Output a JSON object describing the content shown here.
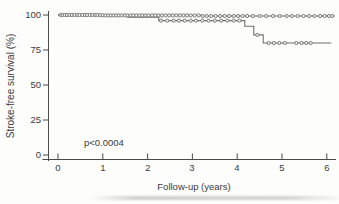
{
  "figure": {
    "background": "#fdfdfc"
  },
  "chart_data": {
    "type": "line",
    "subtype": "kaplan_meier_step_curves",
    "title": "",
    "xlabel": "Follow-up (years)",
    "ylabel": "Stroke-free survival (%)",
    "annotation": "p<0.0004",
    "xlim": [
      0,
      6.2
    ],
    "ylim": [
      0,
      100
    ],
    "xticks": [
      0,
      1,
      2,
      3,
      4,
      5,
      6
    ],
    "yticks": [
      100,
      75,
      50,
      25,
      0
    ],
    "xtick_labels": [
      "0",
      "1",
      "2",
      "3",
      "4",
      "5",
      "6"
    ],
    "ytick_labels": [
      "100",
      "75",
      "50",
      "25",
      "0"
    ],
    "grid": false,
    "legend": "none",
    "colors": {
      "curve": "#6f6f6f",
      "marker_fill": "#f3f2f0",
      "axis": "#4a4a4a",
      "text": "#3b3b3b",
      "background": "#fdfdfc"
    },
    "series": [
      {
        "name": "upper-group",
        "points": [
          [
            0,
            100
          ],
          [
            1.0,
            100
          ],
          [
            1.0,
            99.7
          ],
          [
            3.2,
            99.7
          ],
          [
            3.2,
            99.3
          ],
          [
            6.18,
            99.3
          ]
        ],
        "censor_x": [
          0.06,
          0.1,
          0.15,
          0.2,
          0.26,
          0.31,
          0.37,
          0.43,
          0.48,
          0.54,
          0.6,
          0.65,
          0.71,
          0.77,
          0.83,
          0.88,
          0.94,
          1.0,
          1.06,
          1.12,
          1.18,
          1.24,
          1.3,
          1.36,
          1.42,
          1.49,
          1.55,
          1.62,
          1.68,
          1.75,
          1.82,
          1.88,
          1.95,
          2.02,
          2.1,
          2.17,
          2.24,
          2.32,
          2.4,
          2.48,
          2.56,
          2.64,
          2.72,
          2.8,
          2.88,
          2.96,
          3.05,
          3.14,
          3.23,
          3.32,
          3.42,
          3.52,
          3.62,
          3.72,
          3.82,
          3.92,
          4.02,
          4.12,
          4.22,
          4.35,
          4.5,
          4.65,
          4.8,
          4.95,
          5.1,
          5.22,
          5.35,
          5.48,
          5.6,
          5.72,
          5.85,
          5.95,
          6.05,
          6.12
        ]
      },
      {
        "name": "lower-group",
        "points": [
          [
            0,
            100
          ],
          [
            1.55,
            100
          ],
          [
            1.55,
            98.4
          ],
          [
            2.25,
            98.4
          ],
          [
            2.25,
            96
          ],
          [
            4.17,
            96
          ],
          [
            4.17,
            92
          ],
          [
            4.37,
            92
          ],
          [
            4.37,
            85.8
          ],
          [
            4.58,
            85.8
          ],
          [
            4.58,
            80
          ],
          [
            6.1,
            80
          ]
        ],
        "censor_x": [
          2.3,
          2.44,
          2.58,
          2.7,
          2.83,
          2.96,
          3.08,
          3.22,
          3.36,
          3.5,
          3.64,
          3.78,
          3.92,
          4.05,
          4.45,
          4.7,
          4.82,
          4.94,
          5.06,
          5.32,
          5.44,
          5.54,
          5.64
        ]
      }
    ]
  }
}
